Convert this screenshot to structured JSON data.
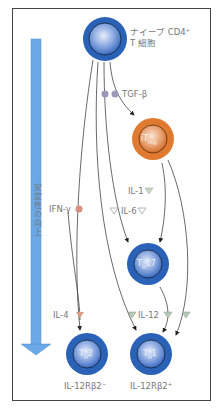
{
  "axis": {
    "label": "安定性の向上",
    "arrow_color": "#6aa8e8"
  },
  "colors": {
    "blue_cell": "#2a62b8",
    "orange_cell": "#e07a30",
    "tgf_dot": "#9a9ab8",
    "ifn_dot": "#d89080",
    "il4_tri": "#d8a080",
    "il_tri": "#b8c8b8",
    "arrow_line": "#444444"
  },
  "cells": {
    "naive": {
      "label_line1": "ナイーブ CD4⁺",
      "label_line2": "T 細胞"
    },
    "itreg": {
      "label_main": "iT",
      "label_sub": "reg"
    },
    "th17": {
      "label_main": "T",
      "label_sub": "H",
      "label_suffix": "17"
    },
    "th2": {
      "label_main": "T",
      "label_sub": "H",
      "label_suffix": "2"
    },
    "th1": {
      "label_main": "T",
      "label_sub": "H",
      "label_suffix": "1"
    }
  },
  "cytokines": {
    "tgf": "TGF-β",
    "il1": "IL-1",
    "il6": "IL-6",
    "ifn": "IFN-γ",
    "il4": "IL-4",
    "il12": "IL-12"
  },
  "bottom_labels": {
    "th2": "IL-12Rβ2⁻",
    "th1": "IL-12Rβ2⁺"
  }
}
